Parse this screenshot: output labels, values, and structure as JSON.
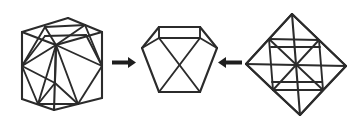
{
  "figure": {
    "title": "Cuboctahedron as common truncation of cube and octahedron",
    "background_color": "#ffffff",
    "line_color": "#2b2b2b",
    "arrow_color": "#1e1e1e",
    "canvas": {
      "width": 357,
      "height": 125
    }
  },
  "panels": [
    {
      "id": "cube-panel",
      "label": "cube-with-inscribed-cuboctahedron",
      "shape_name": "cube",
      "inscribed_shape": "cuboctahedron",
      "description": "Cube drawn in three-quarter view with the edge-midpoint cuboctahedron inscribed inside",
      "center": {
        "x": 62,
        "y": 62
      }
    },
    {
      "id": "hexagon-panel",
      "label": "cuboctahedron-hexagonal-view",
      "shape_name": "cuboctahedron",
      "inscribed_shape": "hexagonal-cross-section",
      "description": "Cuboctahedron seen along a three-fold axis giving a regular hexagon outline",
      "center": {
        "x": 178,
        "y": 62
      }
    },
    {
      "id": "octahedron-panel",
      "label": "octahedron-with-inscribed-cuboctahedron",
      "shape_name": "octahedron",
      "inscribed_shape": "cuboctahedron",
      "description": "Octahedron drawn as a tilted square bipyramid with the edge-midpoint cuboctahedron inscribed",
      "center": {
        "x": 296,
        "y": 62
      }
    }
  ],
  "arrows": [
    {
      "id": "arrow-left",
      "name": "arrow-cube-to-hexagon",
      "direction": "right",
      "from_panel": "cube-panel",
      "to_panel": "hexagon-panel",
      "x": 112,
      "y": 62,
      "length": 24
    },
    {
      "id": "arrow-right",
      "name": "arrow-octahedron-to-hexagon",
      "direction": "left",
      "from_panel": "octahedron-panel",
      "to_panel": "hexagon-panel",
      "x": 218,
      "y": 62,
      "length": 24
    }
  ],
  "geometry": {
    "cube": {
      "outline": [
        [
          22,
          32
        ],
        [
          22,
          99
        ],
        [
          54,
          110
        ],
        [
          102,
          98
        ],
        [
          102,
          32
        ],
        [
          68,
          18
        ]
      ],
      "edges_outer": [
        [
          [
            22,
            32
          ],
          [
            22,
            99
          ]
        ],
        [
          [
            22,
            99
          ],
          [
            54,
            110
          ]
        ],
        [
          [
            54,
            110
          ],
          [
            102,
            98
          ]
        ],
        [
          [
            102,
            98
          ],
          [
            102,
            32
          ]
        ],
        [
          [
            102,
            32
          ],
          [
            68,
            18
          ]
        ],
        [
          [
            68,
            18
          ],
          [
            22,
            32
          ]
        ],
        [
          [
            22,
            32
          ],
          [
            56,
            45
          ]
        ],
        [
          [
            56,
            45
          ],
          [
            102,
            32
          ]
        ],
        [
          [
            56,
            45
          ],
          [
            54,
            110
          ]
        ]
      ],
      "inscribed_edges": [
        [
          [
            22,
            66
          ],
          [
            38,
            24
          ]
        ],
        [
          [
            38,
            24
          ],
          [
            85,
            25
          ]
        ],
        [
          [
            85,
            25
          ],
          [
            102,
            66
          ]
        ],
        [
          [
            102,
            66
          ],
          [
            78,
            104
          ]
        ],
        [
          [
            78,
            104
          ],
          [
            38,
            105
          ]
        ],
        [
          [
            38,
            105
          ],
          [
            22,
            66
          ]
        ],
        [
          [
            38,
            24
          ],
          [
            56,
            45
          ]
        ],
        [
          [
            85,
            25
          ],
          [
            56,
            45
          ]
        ],
        [
          [
            22,
            66
          ],
          [
            56,
            45
          ]
        ],
        [
          [
            102,
            66
          ],
          [
            56,
            45
          ]
        ],
        [
          [
            38,
            105
          ],
          [
            56,
            45
          ]
        ],
        [
          [
            78,
            104
          ],
          [
            56,
            45
          ]
        ],
        [
          [
            22,
            66
          ],
          [
            38,
            105
          ]
        ],
        [
          [
            78,
            104
          ],
          [
            102,
            66
          ]
        ],
        [
          [
            38,
            38
          ],
          [
            85,
            38
          ]
        ],
        [
          [
            22,
            66
          ],
          [
            38,
            38
          ]
        ],
        [
          [
            102,
            66
          ],
          [
            85,
            38
          ]
        ]
      ]
    },
    "hexagon": {
      "outline": [
        [
          142,
          48
        ],
        [
          159,
          27
        ],
        [
          200,
          27
        ],
        [
          217,
          48
        ],
        [
          200,
          92
        ],
        [
          159,
          92
        ]
      ],
      "inner_edges": [
        [
          [
            159,
            27
          ],
          [
            142,
            48
          ]
        ],
        [
          [
            142,
            48
          ],
          [
            159,
            92
          ]
        ],
        [
          [
            159,
            92
          ],
          [
            200,
            92
          ]
        ],
        [
          [
            200,
            92
          ],
          [
            217,
            48
          ]
        ],
        [
          [
            217,
            48
          ],
          [
            200,
            27
          ]
        ],
        [
          [
            200,
            27
          ],
          [
            159,
            27
          ]
        ],
        [
          [
            159,
            37
          ],
          [
            200,
            37
          ]
        ],
        [
          [
            159,
            27
          ],
          [
            159,
            37
          ]
        ],
        [
          [
            200,
            27
          ],
          [
            200,
            37
          ]
        ],
        [
          [
            142,
            48
          ],
          [
            159,
            37
          ]
        ],
        [
          [
            217,
            48
          ],
          [
            200,
            37
          ]
        ],
        [
          [
            159,
            37
          ],
          [
            200,
            92
          ]
        ],
        [
          [
            200,
            37
          ],
          [
            159,
            92
          ]
        ]
      ]
    },
    "octahedron": {
      "outline": [
        [
          292,
          14
        ],
        [
          346,
          66
        ],
        [
          300,
          115
        ],
        [
          246,
          64
        ]
      ],
      "inner_edges": [
        [
          [
            292,
            14
          ],
          [
            246,
            64
          ]
        ],
        [
          [
            246,
            64
          ],
          [
            300,
            115
          ]
        ],
        [
          [
            300,
            115
          ],
          [
            346,
            66
          ]
        ],
        [
          [
            346,
            66
          ],
          [
            292,
            14
          ]
        ],
        [
          [
            246,
            64
          ],
          [
            346,
            66
          ]
        ],
        [
          [
            292,
            14
          ],
          [
            300,
            115
          ]
        ],
        [
          [
            269,
            39
          ],
          [
            319,
            40
          ]
        ],
        [
          [
            269,
            39
          ],
          [
            273,
            90
          ]
        ],
        [
          [
            273,
            90
          ],
          [
            323,
            90
          ]
        ],
        [
          [
            319,
            40
          ],
          [
            323,
            90
          ]
        ],
        [
          [
            269,
            39
          ],
          [
            323,
            90
          ]
        ],
        [
          [
            319,
            40
          ],
          [
            273,
            90
          ]
        ],
        [
          [
            292,
            14
          ],
          [
            269,
            39
          ]
        ],
        [
          [
            292,
            14
          ],
          [
            319,
            40
          ]
        ],
        [
          [
            246,
            64
          ],
          [
            269,
            39
          ]
        ],
        [
          [
            246,
            64
          ],
          [
            273,
            90
          ]
        ],
        [
          [
            346,
            66
          ],
          [
            319,
            40
          ]
        ],
        [
          [
            346,
            66
          ],
          [
            323,
            90
          ]
        ],
        [
          [
            300,
            115
          ],
          [
            273,
            90
          ]
        ],
        [
          [
            300,
            115
          ],
          [
            323,
            90
          ]
        ],
        [
          [
            269,
            46
          ],
          [
            319,
            47
          ]
        ],
        [
          [
            273,
            83
          ],
          [
            323,
            83
          ]
        ]
      ]
    }
  }
}
